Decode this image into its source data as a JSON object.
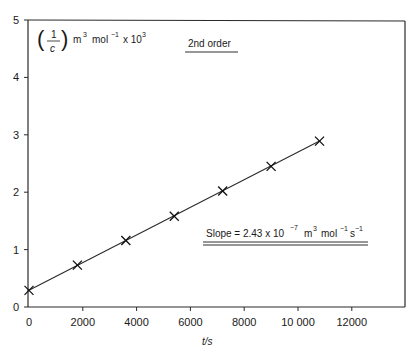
{
  "chart_data": {
    "type": "line",
    "title": "2nd order",
    "xlabel": "t/s",
    "ylabel": "(1/c) m^3 mol^-1 x 10^3",
    "xlim": [
      0,
      14000
    ],
    "ylim": [
      0,
      5
    ],
    "grid": false,
    "x_ticks": [
      "0",
      "2000",
      "4000",
      "6000",
      "8000",
      "10 000",
      "12000"
    ],
    "x_tick_values": [
      0,
      2000,
      4000,
      6000,
      8000,
      10000,
      12000
    ],
    "y_ticks": [
      "0",
      "1",
      "2",
      "3",
      "4",
      "5"
    ],
    "y_tick_values": [
      0,
      1,
      2,
      3,
      4,
      5
    ],
    "series": [
      {
        "name": "1/c vs t",
        "marker": "x",
        "x": [
          0,
          1800,
          3600,
          5400,
          7200,
          9000,
          10800
        ],
        "values": [
          0.29,
          0.73,
          1.16,
          1.58,
          2.02,
          2.45,
          2.89
        ]
      }
    ],
    "fit_line": {
      "x": [
        0,
        10800
      ],
      "y": [
        0.29,
        2.89
      ]
    },
    "annotations": [
      {
        "text": "Slope = 2.43 x 10^-7 m^3 mol^-1 s^-1"
      },
      {
        "text": "2nd order"
      }
    ]
  },
  "labels": {
    "ylabel_frac_num": "1",
    "ylabel_frac_den": "c",
    "ylabel_units_m": "m",
    "ylabel_units_m_exp": "3",
    "ylabel_units_mol": "mol",
    "ylabel_units_mol_exp": "−1",
    "ylabel_units_x": "x 10",
    "ylabel_units_x_exp": "3",
    "title": "2nd order",
    "slope_prefix": "Slope = 2.43 x 10",
    "slope_exp": "−7",
    "slope_m": "m",
    "slope_m_exp": "3",
    "slope_mol": "mol",
    "slope_mol_exp": "−1",
    "slope_s": "s",
    "slope_s_exp": "−1",
    "xlabel": "t/s"
  }
}
